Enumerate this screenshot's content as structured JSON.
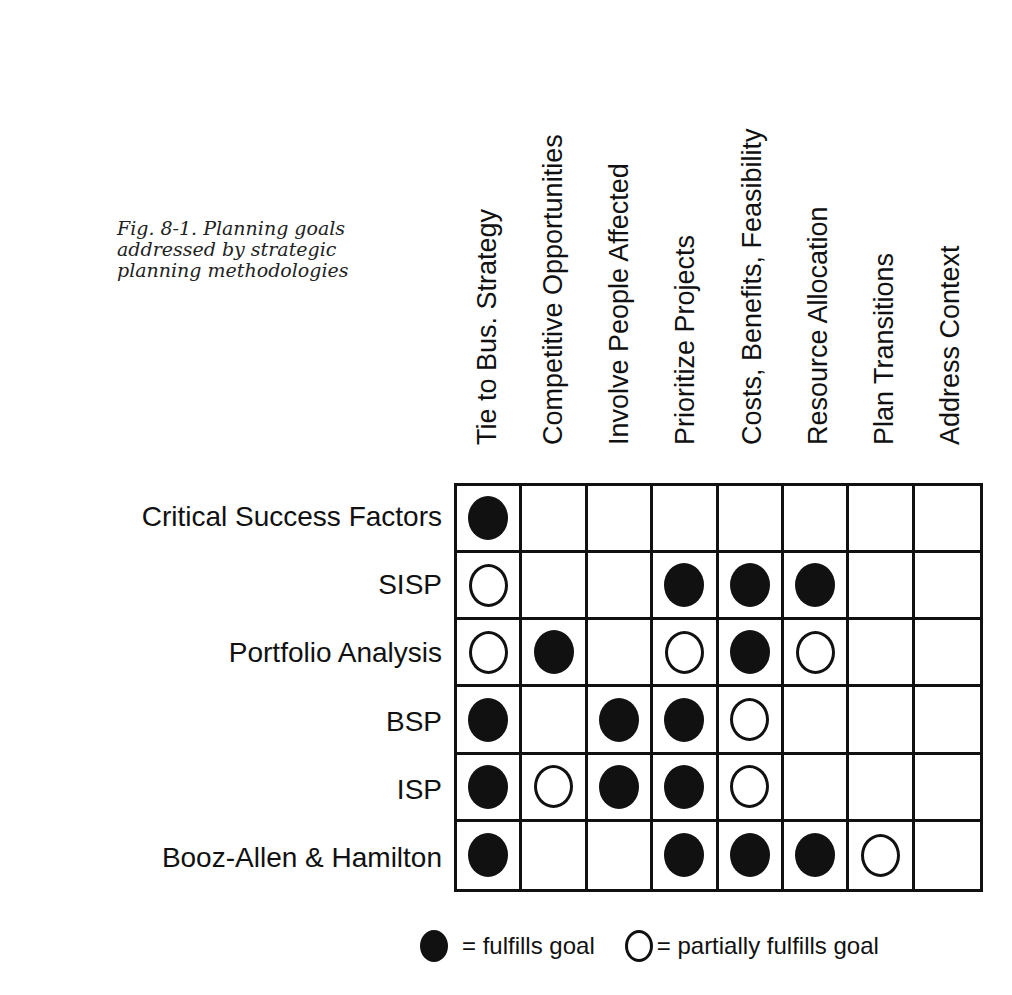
{
  "caption": "Fig. 8-1. Planning goals addressed by strategic planning methodologies",
  "chart_data": {
    "type": "table",
    "title": "Fig. 8-1. Planning goals addressed by strategic planning methodologies",
    "columns": [
      "Tie to Bus. Strategy",
      "Competitive Opportunities",
      "Involve People Affected",
      "Prioritize Projects",
      "Costs, Benefits, Feasibility",
      "Resource Allocation",
      "Plan Transitions",
      "Address Context"
    ],
    "rows": [
      {
        "label": "Critical Success Factors",
        "values": [
          "full",
          "",
          "",
          "",
          "",
          "",
          "",
          ""
        ]
      },
      {
        "label": "SISP",
        "values": [
          "partial",
          "",
          "",
          "full",
          "full",
          "full",
          "",
          ""
        ]
      },
      {
        "label": "Portfolio Analysis",
        "values": [
          "partial",
          "full",
          "",
          "partial",
          "full",
          "partial",
          "",
          ""
        ]
      },
      {
        "label": "BSP",
        "values": [
          "full",
          "",
          "full",
          "full",
          "partial",
          "",
          "",
          ""
        ]
      },
      {
        "label": "ISP",
        "values": [
          "full",
          "partial",
          "full",
          "full",
          "partial",
          "",
          "",
          ""
        ]
      },
      {
        "label": "Booz-Allen & Hamilton",
        "values": [
          "full",
          "",
          "",
          "full",
          "full",
          "full",
          "partial",
          ""
        ]
      }
    ],
    "legend": [
      {
        "symbol": "full",
        "label": "= fulfills goal"
      },
      {
        "symbol": "partial",
        "label": "= partially fulfills goal"
      }
    ]
  }
}
